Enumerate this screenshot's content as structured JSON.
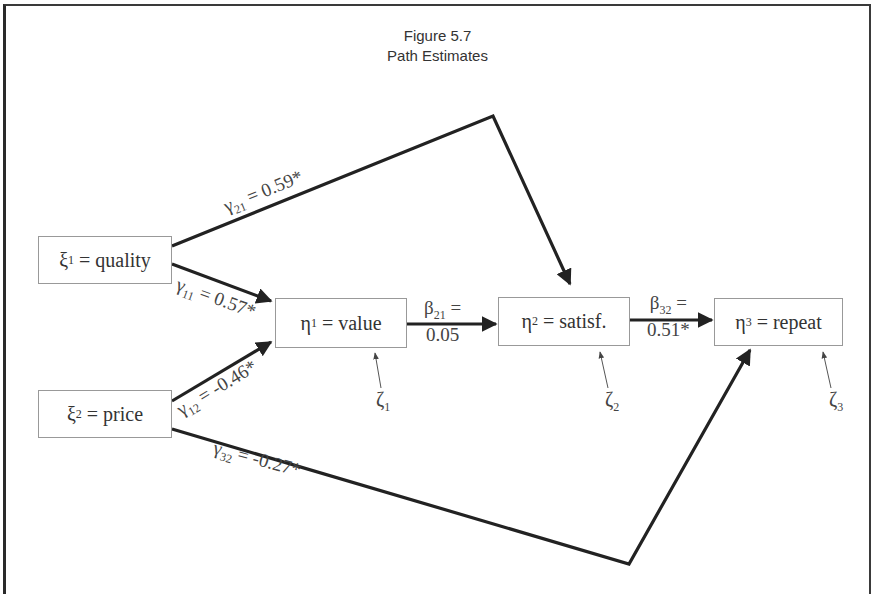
{
  "title": {
    "line1": "Figure 5.7",
    "line2": "Path Estimates"
  },
  "nodes": {
    "quality": {
      "symbol": "ξ",
      "sub": "1",
      "label": "= quality"
    },
    "price": {
      "symbol": "ξ",
      "sub": "2",
      "label": "= price"
    },
    "value": {
      "symbol": "η",
      "sub": "1",
      "label": "= value"
    },
    "satisf": {
      "symbol": "η",
      "sub": "2",
      "label": "= satisf."
    },
    "repeat": {
      "symbol": "η",
      "sub": "3",
      "label": "= repeat"
    }
  },
  "errors": {
    "zeta1": {
      "symbol": "ζ",
      "sub": "1"
    },
    "zeta2": {
      "symbol": "ζ",
      "sub": "2"
    },
    "zeta3": {
      "symbol": "ζ",
      "sub": "3"
    }
  },
  "paths": {
    "gamma21": {
      "symbol": "γ",
      "sub": "21",
      "value": "= 0.59*",
      "from": "quality",
      "to": "satisf"
    },
    "gamma11": {
      "symbol": "γ",
      "sub": "11",
      "value": "= 0.57*",
      "from": "quality",
      "to": "value"
    },
    "gamma12": {
      "symbol": "γ",
      "sub": "12",
      "value": "= -0.46*",
      "from": "price",
      "to": "value"
    },
    "gamma32": {
      "symbol": "γ",
      "sub": "32",
      "value": "= -0.27*",
      "from": "price",
      "to": "repeat"
    },
    "beta21": {
      "symbol": "β",
      "sub": "21",
      "eq": "=",
      "value": "0.05",
      "from": "value",
      "to": "satisf"
    },
    "beta32": {
      "symbol": "β",
      "sub": "32",
      "eq": "=",
      "value": "0.51*",
      "from": "satisf",
      "to": "repeat"
    }
  },
  "colors": {
    "line": "#222222",
    "text": "#333333",
    "frame": "#2a2a2a"
  }
}
